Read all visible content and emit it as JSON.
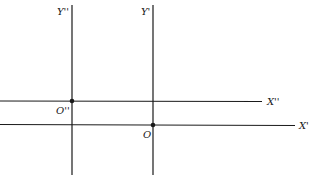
{
  "diagram": {
    "colors": {
      "line": "#1a1a1a",
      "background": "#ffffff"
    },
    "axes": [
      {
        "id": "y_double_prime",
        "label": "Y''",
        "orientation": "vertical",
        "x": 72,
        "y1": 5,
        "y2": 175
      },
      {
        "id": "y_prime",
        "label": "Y'",
        "orientation": "vertical",
        "x": 153,
        "y1": 5,
        "y2": 175
      },
      {
        "id": "x_double_prime",
        "label": "X''",
        "orientation": "horizontal",
        "y": 101,
        "x1": 0,
        "x2": 262
      },
      {
        "id": "x_prime",
        "label": "X'",
        "orientation": "horizontal",
        "y": 125,
        "x1": 0,
        "x2": 295
      }
    ],
    "origins": [
      {
        "id": "origin_double_prime",
        "label": "O''",
        "x": 72,
        "y": 101
      },
      {
        "id": "origin_prime",
        "label": "O",
        "x": 153,
        "y": 125
      }
    ],
    "labels": {
      "y_double_prime": "Y''",
      "y_prime": "Y'",
      "x_double_prime": "X''",
      "x_prime": "X'",
      "origin_double_prime": "O''",
      "origin": "O"
    }
  }
}
